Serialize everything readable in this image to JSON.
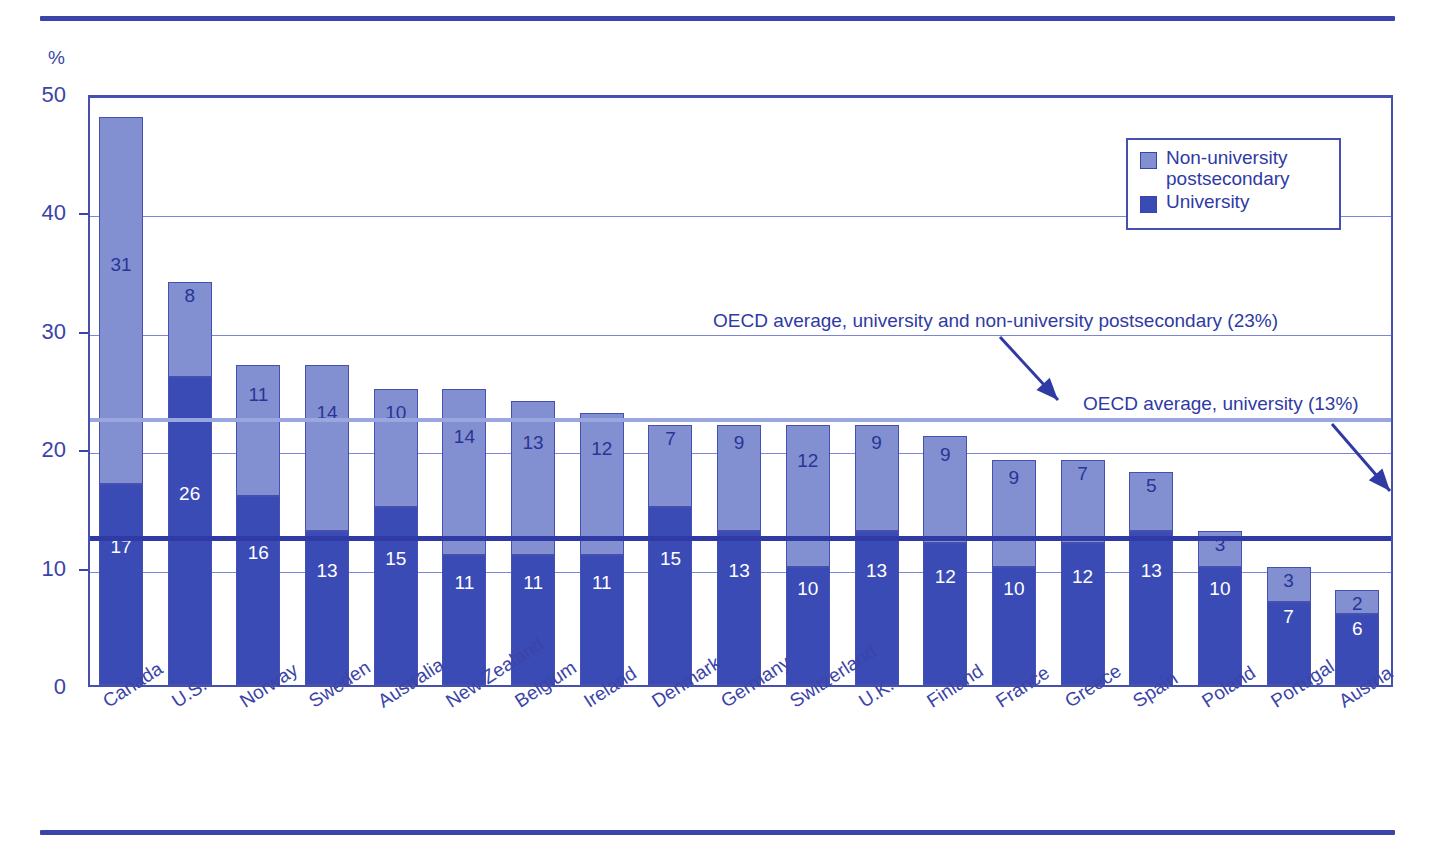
{
  "chart_data": {
    "type": "bar",
    "title": "",
    "subtitle": "",
    "xlabel": "",
    "ylabel": "%",
    "ylim": [
      0,
      50
    ],
    "yticks": [
      0,
      10,
      20,
      30,
      40,
      50
    ],
    "grid": true,
    "stacked": true,
    "legend_position": "top-right",
    "categories": [
      "Canada",
      "U.S.",
      "Norway",
      "Sweden",
      "Australia",
      "New Zealand",
      "Belgium",
      "Ireland",
      "Denmark",
      "Germany",
      "Switzerland",
      "U.K.",
      "Finland",
      "France",
      "Greece",
      "Spain",
      "Poland",
      "Portugal",
      "Austria"
    ],
    "series": [
      {
        "name": "University",
        "color": "#3b4bb5",
        "values": [
          17,
          26,
          16,
          13,
          15,
          11,
          11,
          11,
          15,
          13,
          10,
          13,
          12,
          10,
          12,
          13,
          10,
          7,
          6
        ]
      },
      {
        "name": "Non-university postsecondary",
        "color": "#8290d2",
        "values": [
          31,
          8,
          11,
          14,
          10,
          14,
          13,
          12,
          7,
          9,
          12,
          9,
          9,
          9,
          7,
          5,
          3,
          3,
          2
        ]
      }
    ],
    "totals": [
      48,
      34,
      27,
      27,
      25,
      25,
      24,
      23,
      22,
      22,
      22,
      22,
      21,
      19,
      19,
      18,
      13,
      10,
      8
    ],
    "annotations": [
      {
        "id": "oecd-average-total",
        "text": "OECD average, university and non-university postsecondary (23%)",
        "value": 23,
        "color": "#9aa6e0"
      },
      {
        "id": "oecd-average-university",
        "text": "OECD average, university (13%)",
        "value": 13,
        "color": "#2f3aa5"
      }
    ]
  },
  "legend": {
    "items": [
      {
        "label_line1": "Non-university",
        "label_line2": "postsecondary",
        "swatch": "nonuniversity"
      },
      {
        "label_line1": "University",
        "label_line2": "",
        "swatch": "university"
      }
    ]
  },
  "axis": {
    "unit": "%"
  },
  "colors": {
    "university": "#3b4bb5",
    "nonuniversity": "#8290d2",
    "axis": "#4650b0",
    "grid": "#7d86d4",
    "text": "#3b44a8",
    "rule": "#3b44a8",
    "avg_total_line": "#9aa6e0",
    "avg_university_line": "#2f3aa5"
  }
}
